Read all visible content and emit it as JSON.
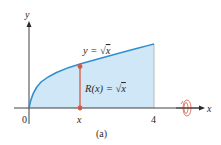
{
  "figure": {
    "caption": "(a)",
    "axes": {
      "x_label": "x",
      "y_label": "y",
      "origin_label": "0",
      "x_ticks": [
        {
          "label": "x",
          "value": 1.6
        },
        {
          "label": "4",
          "value": 4
        }
      ]
    },
    "curve": {
      "equation_prefix": "y = ",
      "equation_radical": "√",
      "equation_var": "x",
      "function": "sqrt(x)",
      "domain": [
        0,
        4
      ]
    },
    "radius": {
      "label_prefix": "R(x) = ",
      "label_radical": "√",
      "label_var": "x",
      "at_x": 1.6
    },
    "rotation_icon": "rotation-about-x-axis-icon",
    "colors": {
      "curve": "#2f8fce",
      "fill": "#cfe7f6",
      "radius_segment": "#d9573f",
      "axes": "#2a2a2a",
      "boundary": "#b9b9b9"
    }
  }
}
